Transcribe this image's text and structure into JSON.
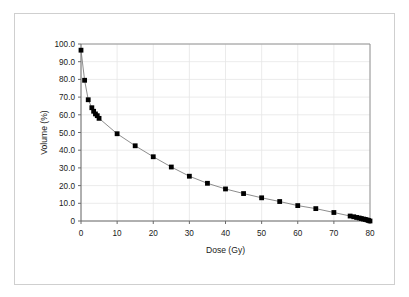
{
  "chart_data": {
    "type": "line",
    "title": "",
    "xlabel": "Dose (Gy)",
    "ylabel": "Volume (%)",
    "xlim": [
      0,
      80
    ],
    "ylim": [
      0,
      100
    ],
    "xticks": [
      "0",
      "10",
      "20",
      "30",
      "40",
      "50",
      "60",
      "70",
      "80"
    ],
    "yticks": [
      "0",
      "10.0",
      "20.0",
      "30.0",
      "40.0",
      "50.0",
      "60.0",
      "70.0",
      "80.0",
      "90.0",
      "100.0"
    ],
    "xtick_values": [
      0,
      10,
      20,
      30,
      40,
      50,
      60,
      70,
      80
    ],
    "ytick_values": [
      0,
      10,
      20,
      30,
      40,
      50,
      60,
      70,
      80,
      90,
      100
    ],
    "grid": true,
    "legend": "none",
    "marker": "square",
    "marker_color": "#000000",
    "line_color": "#808080",
    "grid_color": "#e6e6e6",
    "axis_color": "#808080",
    "series": [
      {
        "name": "Dose-volume histogram",
        "x": [
          0.0,
          1.0,
          2.0,
          3.0,
          3.5,
          4.0,
          4.5,
          5.0,
          10.0,
          15.0,
          20.0,
          25.0,
          30.0,
          35.0,
          40.0,
          45.0,
          50.0,
          55.0,
          60.0,
          65.0,
          70.0,
          74.5,
          75.5,
          76.3,
          77.0,
          77.6,
          78.2,
          78.7,
          79.2,
          79.6,
          80.0
        ],
        "y": [
          96.5,
          79.5,
          68.5,
          64.0,
          62.0,
          60.5,
          59.5,
          58.0,
          49.3,
          42.5,
          36.3,
          30.5,
          25.3,
          21.3,
          18.1,
          15.5,
          13.1,
          11.0,
          8.7,
          7.0,
          4.8,
          2.8,
          2.4,
          2.0,
          1.7,
          1.4,
          1.1,
          0.9,
          0.6,
          0.3,
          0.0
        ]
      }
    ]
  },
  "axis_labels": {
    "x_title": "Dose (Gy)",
    "y_title": "Volume (%)"
  }
}
